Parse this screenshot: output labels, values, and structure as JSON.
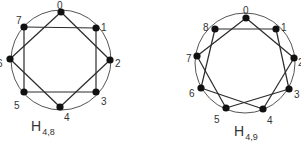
{
  "graphs": [
    {
      "name": "H",
      "subscript": "4,8",
      "circle": {
        "cx": 61,
        "cy": 60,
        "r": 50
      },
      "vertices": [
        {
          "id": "0",
          "x": 61,
          "y": 12,
          "lx": 57,
          "ly": 5
        },
        {
          "id": "1",
          "x": 96,
          "y": 28,
          "lx": 101,
          "ly": 27
        },
        {
          "id": "2",
          "x": 110,
          "y": 60,
          "lx": 115,
          "ly": 63
        },
        {
          "id": "3",
          "x": 96,
          "y": 92,
          "lx": 101,
          "ly": 101
        },
        {
          "id": "4",
          "x": 60,
          "y": 107,
          "lx": 64,
          "ly": 117
        },
        {
          "id": "5",
          "x": 24,
          "y": 92,
          "lx": 14,
          "ly": 105
        },
        {
          "id": "6",
          "x": 10,
          "y": 59,
          "lx": -3,
          "ly": 63
        },
        {
          "id": "7",
          "x": 24,
          "y": 27,
          "lx": 16,
          "ly": 20
        }
      ],
      "edges": [
        [
          0,
          2
        ],
        [
          2,
          4
        ],
        [
          4,
          6
        ],
        [
          6,
          0
        ],
        [
          7,
          1
        ],
        [
          1,
          3
        ],
        [
          3,
          5
        ],
        [
          5,
          7
        ]
      ],
      "label_pos": {
        "x": 31,
        "y": 131
      }
    },
    {
      "name": "H",
      "subscript": "4,9",
      "circle": {
        "cx": 245,
        "cy": 63,
        "r": 50
      },
      "vertices": [
        {
          "id": "0",
          "x": 246,
          "y": 18,
          "lx": 243,
          "ly": 10
        },
        {
          "id": "1",
          "x": 276,
          "y": 29,
          "lx": 281,
          "ly": 27
        },
        {
          "id": "2",
          "x": 294,
          "y": 58,
          "lx": 298,
          "ly": 62
        },
        {
          "id": "3",
          "x": 289,
          "y": 89,
          "lx": 294,
          "ly": 94
        },
        {
          "id": "4",
          "x": 263,
          "y": 109,
          "lx": 267,
          "ly": 120
        },
        {
          "id": "5",
          "x": 226,
          "y": 108,
          "lx": 214,
          "ly": 119
        },
        {
          "id": "6",
          "x": 201,
          "y": 88,
          "lx": 189,
          "ly": 93
        },
        {
          "id": "7",
          "x": 197,
          "y": 56,
          "lx": 186,
          "ly": 58
        },
        {
          "id": "8",
          "x": 215,
          "y": 29,
          "lx": 203,
          "ly": 27
        }
      ],
      "edges": [
        [
          0,
          2
        ],
        [
          2,
          4
        ],
        [
          4,
          6
        ],
        [
          6,
          8
        ],
        [
          8,
          1
        ],
        [
          1,
          3
        ],
        [
          3,
          5
        ],
        [
          5,
          7
        ],
        [
          7,
          0
        ]
      ],
      "label_pos": {
        "x": 234,
        "y": 136
      }
    }
  ],
  "style": {
    "line_color": "#2a2a2a",
    "circle_color": "#555555",
    "vertex_color": "#111111"
  }
}
